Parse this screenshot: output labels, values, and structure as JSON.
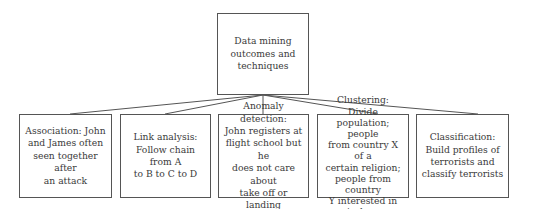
{
  "root": {
    "label_lines": [
      "Data mining",
      "outcomes and",
      "techniques"
    ]
  },
  "children": [
    {
      "label_lines": [
        "Association: John",
        "and James often",
        "seen together after",
        "an attack"
      ]
    },
    {
      "label_lines": [
        "Link analysis:",
        "Follow chain from A",
        "to B to C to D"
      ]
    },
    {
      "label_lines": [
        "Anomaly detection:",
        "John registers at",
        "flight school but he",
        "does not care about",
        "take off or landing"
      ]
    },
    {
      "label_lines": [
        "Clustering: Divide",
        "population; people",
        "from country X of a",
        "certain religion;",
        "people from country",
        "Y interested in",
        "airplanes"
      ]
    },
    {
      "label_lines": [
        "Classification:",
        "Build profiles of",
        "terrorists and",
        "classify terrorists"
      ]
    }
  ]
}
